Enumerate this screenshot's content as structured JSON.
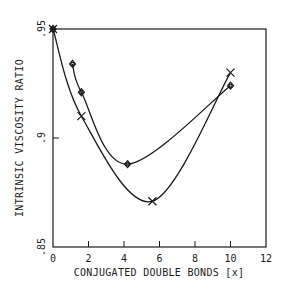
{
  "chart_data": {
    "type": "line",
    "title": "",
    "xlabel": "CONJUGATED DOUBLE BONDS [x]",
    "ylabel": "INTRINSIC VISCOSITY RATIO",
    "xlim": [
      0,
      12
    ],
    "ylim": [
      0.85,
      0.95
    ],
    "x_ticks": [
      0,
      2,
      4,
      6,
      8,
      10,
      12
    ],
    "x_tick_labels": [
      "0",
      "2",
      "4",
      "6",
      "8",
      "10",
      "12"
    ],
    "y_ticks": [
      0.85,
      0.9,
      0.95
    ],
    "y_tick_labels": [
      ".85",
      ".9",
      ".95"
    ],
    "grid": false,
    "legend": null,
    "series": [
      {
        "name": "diamond series",
        "marker": "diamond",
        "x": [
          0,
          1.1,
          1.6,
          4.2,
          10.0
        ],
        "y": [
          0.95,
          0.934,
          0.921,
          0.888,
          0.924
        ]
      },
      {
        "name": "cross series",
        "marker": "x",
        "x": [
          0,
          1.6,
          5.6,
          10.0
        ],
        "y": [
          0.95,
          0.91,
          0.871,
          0.93
        ]
      }
    ]
  }
}
